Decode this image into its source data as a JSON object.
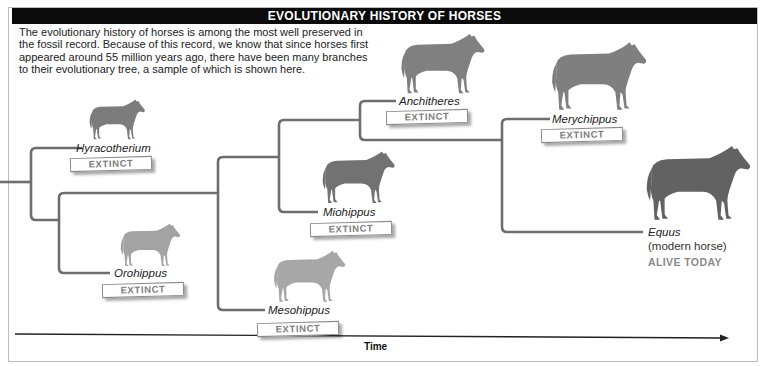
{
  "header": {
    "title": "EVOLUTIONARY HISTORY OF HORSES"
  },
  "intro": {
    "text": "The evolutionary history of horses is among the most well preserved in the fossil record. Because of this record, we know that since horses first appeared around 55 million years ago, there have been many branches to their evolutionary tree, a sample of which is shown here."
  },
  "colors": {
    "header_bg": "#0b0b0b",
    "branch_line": "#6e6e6e",
    "horse_fill_early": "#8c8c8c",
    "horse_fill_modern": "#6a6a6a",
    "extinct_text": "#7d7d7d",
    "alive_text": "#8a8a8a"
  },
  "taxa": [
    {
      "name": "Hyracotherium",
      "status": "EXTINCT",
      "icon": "horse-spotted-small"
    },
    {
      "name": "Orohippus",
      "status": "EXTINCT",
      "icon": "horse-spotted-small"
    },
    {
      "name": "Mesohippus",
      "status": "EXTINCT",
      "icon": "horse-spotted"
    },
    {
      "name": "Miohippus",
      "status": "EXTINCT",
      "icon": "horse-striped"
    },
    {
      "name": "Anchitheres",
      "status": "EXTINCT",
      "icon": "horse"
    },
    {
      "name": "Merychippus",
      "status": "EXTINCT",
      "icon": "horse"
    },
    {
      "name": "Equus",
      "subtitle": "(modern horse)",
      "status": "ALIVE TODAY",
      "icon": "horse-modern"
    }
  ],
  "axis": {
    "label": "Time",
    "direction": "left-to-right"
  }
}
